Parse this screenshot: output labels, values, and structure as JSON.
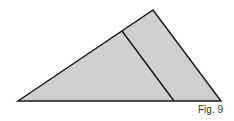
{
  "figure": {
    "caption": "Fig. 9",
    "fill_color": "#d0d0d0",
    "stroke_color": "#1a1a1a",
    "triangle": [
      [
        18,
        101
      ],
      [
        153,
        10
      ],
      [
        221,
        101
      ]
    ],
    "divider": [
      [
        122,
        31
      ],
      [
        174,
        101
      ]
    ]
  }
}
